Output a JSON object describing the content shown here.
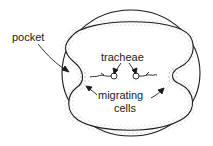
{
  "diagram": {
    "type": "biological cross-section",
    "labels": {
      "pocket": "pocket",
      "tracheae": "tracheae",
      "migrating": "migrating",
      "cells": "cells"
    },
    "colors": {
      "line": "#1a1a1a",
      "stipple": "#555555",
      "background": "#ffffff"
    }
  }
}
